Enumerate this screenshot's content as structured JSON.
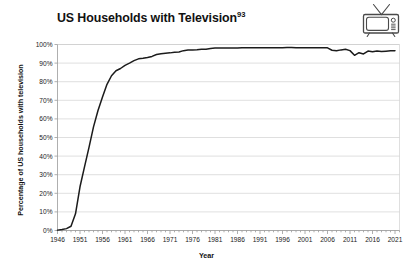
{
  "figure": {
    "title": "US Households with Television",
    "title_superscript": "93",
    "icon": "television-icon",
    "background_color": "#ffffff",
    "line_color": "#1b1b1b",
    "grid_color": "#c9c9c9"
  },
  "chart_data": {
    "type": "line",
    "title": "US Households with Television",
    "xlabel": "Year",
    "ylabel": "Percentage of US households with television",
    "xlim": [
      1946,
      2022
    ],
    "ylim": [
      0,
      100
    ],
    "grid": true,
    "legend": "none",
    "xticks": [
      "1946",
      "1951",
      "1956",
      "1961",
      "1966",
      "1971",
      "1976",
      "1981",
      "1986",
      "1991",
      "1996",
      "2001",
      "2006",
      "2011",
      "2016",
      "2021"
    ],
    "yticks": [
      "0%",
      "10%",
      "20%",
      "30%",
      "40%",
      "50%",
      "60%",
      "70%",
      "80%",
      "90%",
      "100%"
    ],
    "series": [
      {
        "name": "US households with television",
        "x": [
          1946,
          1947,
          1948,
          1949,
          1950,
          1951,
          1952,
          1953,
          1954,
          1955,
          1956,
          1957,
          1958,
          1959,
          1960,
          1961,
          1962,
          1963,
          1964,
          1965,
          1966,
          1967,
          1968,
          1969,
          1970,
          1971,
          1972,
          1973,
          1974,
          1975,
          1976,
          1977,
          1978,
          1979,
          1980,
          1981,
          1982,
          1983,
          1984,
          1985,
          1986,
          1987,
          1988,
          1989,
          1990,
          1991,
          1992,
          1993,
          1994,
          1995,
          1996,
          1997,
          1998,
          1999,
          2000,
          2001,
          2002,
          2003,
          2004,
          2005,
          2006,
          2007,
          2008,
          2009,
          2010,
          2011,
          2012,
          2013,
          2014,
          2015,
          2016,
          2017,
          2018,
          2019,
          2020,
          2021
        ],
        "y": [
          0.2,
          0.5,
          1.0,
          2.3,
          9.0,
          23.5,
          34.2,
          44.7,
          55.7,
          64.5,
          71.8,
          78.6,
          83.2,
          85.9,
          87.1,
          88.8,
          90.0,
          91.3,
          92.3,
          92.6,
          93.0,
          93.6,
          94.6,
          95.0,
          95.3,
          95.5,
          95.8,
          96.0,
          96.7,
          97.0,
          97.1,
          97.2,
          97.4,
          97.5,
          97.9,
          98.1,
          98.1,
          98.1,
          98.1,
          98.1,
          98.1,
          98.2,
          98.2,
          98.2,
          98.2,
          98.3,
          98.3,
          98.3,
          98.3,
          98.3,
          98.3,
          98.4,
          98.4,
          98.2,
          98.2,
          98.2,
          98.2,
          98.2,
          98.2,
          98.2,
          98.2,
          96.9,
          96.6,
          97.1,
          97.4,
          96.7,
          94.2,
          95.6,
          94.9,
          96.5,
          96.1,
          96.5,
          96.2,
          96.4,
          96.6,
          96.7
        ]
      }
    ]
  }
}
